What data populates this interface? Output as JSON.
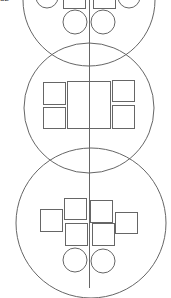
{
  "diagram": {
    "corner_label": "32",
    "stroke_color": "#666666",
    "axis": {
      "x": 89,
      "y1": 0,
      "y2": 288
    },
    "sections": [
      {
        "name": "top-section",
        "big_circle": {
          "cx": 89,
          "cy": 0,
          "r": 66
        },
        "rects": [
          {
            "x": 63,
            "y": -14,
            "w": 22,
            "h": 22
          },
          {
            "x": 93,
            "y": -14,
            "w": 22,
            "h": 22
          }
        ],
        "circles": [
          {
            "cx": 47,
            "cy": -3,
            "r": 11
          },
          {
            "cx": 129,
            "cy": -3,
            "r": 11
          },
          {
            "cx": 75,
            "cy": 22,
            "r": 12
          },
          {
            "cx": 103,
            "cy": 22,
            "r": 12
          }
        ]
      },
      {
        "name": "middle-section",
        "big_circle": {
          "cx": 89,
          "cy": 108,
          "r": 65
        },
        "rects": [
          {
            "x": 43,
            "y": 82,
            "w": 22,
            "h": 22
          },
          {
            "x": 43,
            "y": 107,
            "w": 22,
            "h": 21
          },
          {
            "x": 67,
            "y": 81,
            "w": 43,
            "h": 47
          },
          {
            "x": 112,
            "y": 80,
            "w": 22,
            "h": 21
          },
          {
            "x": 112,
            "y": 105,
            "w": 22,
            "h": 23
          }
        ],
        "circles": []
      },
      {
        "name": "bottom-section",
        "big_circle": {
          "cx": 91,
          "cy": 223,
          "r": 75
        },
        "rects": [
          {
            "x": 40,
            "y": 209,
            "w": 22,
            "h": 22
          },
          {
            "x": 64,
            "y": 198,
            "w": 22,
            "h": 21
          },
          {
            "x": 90,
            "y": 200,
            "w": 22,
            "h": 22
          },
          {
            "x": 115,
            "y": 212,
            "w": 22,
            "h": 21
          },
          {
            "x": 65,
            "y": 223,
            "w": 22,
            "h": 22
          },
          {
            "x": 92,
            "y": 223,
            "w": 22,
            "h": 22
          }
        ],
        "circles": [
          {
            "cx": 75,
            "cy": 260,
            "r": 12
          },
          {
            "cx": 103,
            "cy": 261,
            "r": 12
          }
        ]
      }
    ]
  }
}
